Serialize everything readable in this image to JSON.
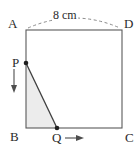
{
  "figure": {
    "type": "geometry-diagram",
    "vertices": {
      "A": "A",
      "B": "B",
      "C": "C",
      "D": "D"
    },
    "points": {
      "P": "P",
      "Q": "Q"
    },
    "dimension": {
      "top_length": "8 cm"
    },
    "icons": {
      "p_motion": "arrow-down-icon",
      "q_motion": "arrow-right-icon",
      "dimension_arc": "dashed-arc-icon"
    },
    "colors": {
      "stroke": "#4d4d4d",
      "label": "#2b2b2b",
      "shade_fill": "#ececec",
      "background": "#ffffff"
    },
    "geometry": {
      "rect_left": 26,
      "rect_top": 30,
      "rect_right": 122,
      "rect_bottom": 128,
      "p_x": 26,
      "p_y": 63,
      "q_x": 57,
      "q_y": 128
    }
  }
}
